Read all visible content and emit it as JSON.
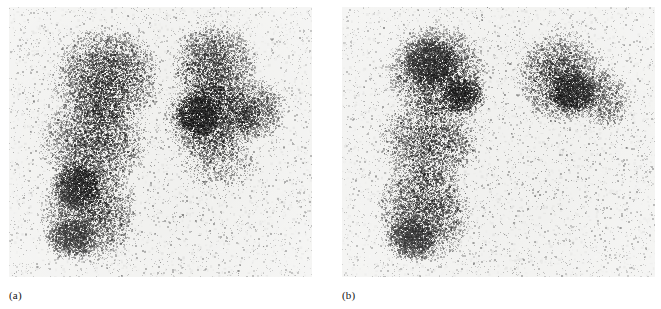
{
  "figure": {
    "type": "nuclear-medicine-scintigraphy",
    "modality": "gamma camera planar scintigram",
    "background_color": "#ffffff",
    "width": 661,
    "height": 309
  },
  "panels": [
    {
      "id": "a",
      "caption": "(a)",
      "bounds": {
        "x": 9,
        "y": 7,
        "width": 303,
        "height": 270
      },
      "film_base_color": "#f1f1ef",
      "speckle_color": "#1b1b1b",
      "description": "Both lung fields demonstrate distributed radiotracer uptake with granular counting statistics.",
      "regions": [
        {
          "name": "right-lung-upper",
          "cx": 0.32,
          "cy": 0.26,
          "rx": 0.19,
          "ry": 0.2,
          "density": 0.62
        },
        {
          "name": "right-lung-mid",
          "cx": 0.28,
          "cy": 0.5,
          "rx": 0.19,
          "ry": 0.19,
          "density": 0.52
        },
        {
          "name": "right-lung-lower",
          "cx": 0.26,
          "cy": 0.76,
          "rx": 0.17,
          "ry": 0.2,
          "density": 0.58
        },
        {
          "name": "right-lung-hilar-focus",
          "cx": 0.22,
          "cy": 0.66,
          "rx": 0.09,
          "ry": 0.1,
          "density": 0.72
        },
        {
          "name": "right-lung-basal-focus",
          "cx": 0.2,
          "cy": 0.86,
          "rx": 0.09,
          "ry": 0.08,
          "density": 0.74
        },
        {
          "name": "left-lung-upper",
          "cx": 0.68,
          "cy": 0.22,
          "rx": 0.15,
          "ry": 0.17,
          "density": 0.6
        },
        {
          "name": "left-lung-mid",
          "cx": 0.67,
          "cy": 0.42,
          "rx": 0.17,
          "ry": 0.16,
          "density": 0.66
        },
        {
          "name": "left-lung-hilar-focus",
          "cx": 0.62,
          "cy": 0.4,
          "rx": 0.08,
          "ry": 0.09,
          "density": 0.8
        },
        {
          "name": "left-lung-lateral",
          "cx": 0.82,
          "cy": 0.38,
          "rx": 0.1,
          "ry": 0.12,
          "density": 0.52
        },
        {
          "name": "left-lung-lower-faint",
          "cx": 0.7,
          "cy": 0.58,
          "rx": 0.14,
          "ry": 0.1,
          "density": 0.22
        }
      ]
    },
    {
      "id": "b",
      "caption": "(b)",
      "bounds": {
        "x": 342,
        "y": 7,
        "width": 313,
        "height": 270
      },
      "film_base_color": "#f1f1ef",
      "speckle_color": "#1b1b1b",
      "description": "Right lung field shows preserved tracer distribution throughout; the left lower zone shows a large photopenic defect with absent uptake.",
      "regions": [
        {
          "name": "right-lung-upper",
          "cx": 0.3,
          "cy": 0.24,
          "rx": 0.17,
          "ry": 0.19,
          "density": 0.66
        },
        {
          "name": "right-lung-apical-focus",
          "cx": 0.28,
          "cy": 0.2,
          "rx": 0.09,
          "ry": 0.1,
          "density": 0.76
        },
        {
          "name": "right-lung-hilar-focus",
          "cx": 0.39,
          "cy": 0.33,
          "rx": 0.08,
          "ry": 0.08,
          "density": 0.78
        },
        {
          "name": "right-lung-mid",
          "cx": 0.28,
          "cy": 0.5,
          "rx": 0.17,
          "ry": 0.18,
          "density": 0.52
        },
        {
          "name": "right-lung-lower",
          "cx": 0.26,
          "cy": 0.76,
          "rx": 0.16,
          "ry": 0.2,
          "density": 0.6
        },
        {
          "name": "right-lung-basal-focus",
          "cx": 0.22,
          "cy": 0.86,
          "rx": 0.09,
          "ry": 0.09,
          "density": 0.72
        },
        {
          "name": "left-lung-upper",
          "cx": 0.7,
          "cy": 0.26,
          "rx": 0.15,
          "ry": 0.18,
          "density": 0.6
        },
        {
          "name": "left-lung-hilar-focus",
          "cx": 0.74,
          "cy": 0.32,
          "rx": 0.08,
          "ry": 0.09,
          "density": 0.74
        },
        {
          "name": "left-lung-lateral",
          "cx": 0.84,
          "cy": 0.34,
          "rx": 0.09,
          "ry": 0.12,
          "density": 0.44
        },
        {
          "name": "left-lower-photopenic-defect",
          "cx": 0.74,
          "cy": 0.72,
          "rx": 0.24,
          "ry": 0.26,
          "density": 0.0
        }
      ]
    }
  ]
}
